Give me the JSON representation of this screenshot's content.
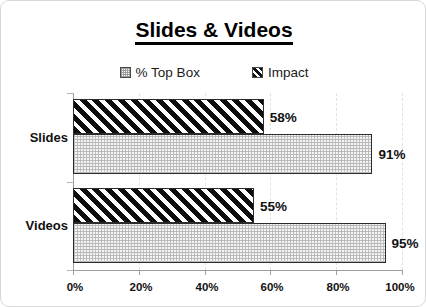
{
  "chart_data": {
    "type": "bar",
    "orientation": "horizontal",
    "title": "Slides & Videos",
    "xlabel": "",
    "ylabel": "",
    "grid": true,
    "legend_position": "top",
    "xlim": [
      0,
      100
    ],
    "xticks": [
      "0%",
      "20%",
      "40%",
      "60%",
      "80%",
      "100%"
    ],
    "xtick_values": [
      0,
      20,
      40,
      60,
      80,
      100
    ],
    "categories": [
      "Slides",
      "Videos"
    ],
    "series": [
      {
        "name": "Impact",
        "pattern": "diagonal-hatch",
        "values": [
          58,
          55
        ],
        "labels": [
          "58%",
          "55%"
        ]
      },
      {
        "name": "% Top Box",
        "pattern": "dotted-stipple",
        "values": [
          91,
          95
        ],
        "labels": [
          "91%",
          "95%"
        ]
      }
    ],
    "colors": {
      "impact_fill": "#101010",
      "impact_stripe": "#ffffff",
      "topbox_fill": "#f4f4f4",
      "topbox_dots": "#b9b9b9",
      "bar_border": "#2b2b2b",
      "axis": "#9d9d9d",
      "gridline": "#e2e2e2",
      "text": "#111111",
      "card_border": "#d8d8d8"
    }
  },
  "legend": {
    "entries": [
      {
        "label": "% Top Box",
        "icon": "dotted-square-swatch"
      },
      {
        "label": "Impact",
        "icon": "hatched-square-swatch"
      }
    ]
  },
  "axis": {
    "ticks": [
      {
        "label": "0%"
      },
      {
        "label": "20%"
      },
      {
        "label": "40%"
      },
      {
        "label": "60%"
      },
      {
        "label": "80%"
      },
      {
        "label": "100%"
      }
    ]
  },
  "groups": [
    {
      "category": "Slides",
      "bars": [
        {
          "series": "Impact",
          "value": 58,
          "label": "58%"
        },
        {
          "series": "% Top Box",
          "value": 91,
          "label": "91%"
        }
      ]
    },
    {
      "category": "Videos",
      "bars": [
        {
          "series": "Impact",
          "value": 55,
          "label": "55%"
        },
        {
          "series": "% Top Box",
          "value": 95,
          "label": "95%"
        }
      ]
    }
  ]
}
